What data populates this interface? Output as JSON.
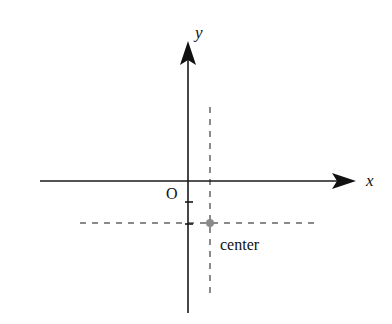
{
  "diagram": {
    "axes": {
      "x_label": "x",
      "y_label": "y",
      "origin_label": "O"
    },
    "point": {
      "label": "center"
    },
    "colors": {
      "axis": "#1a1a1a",
      "dashed": "#8a8a8a",
      "point": "#8a8a8a"
    }
  }
}
